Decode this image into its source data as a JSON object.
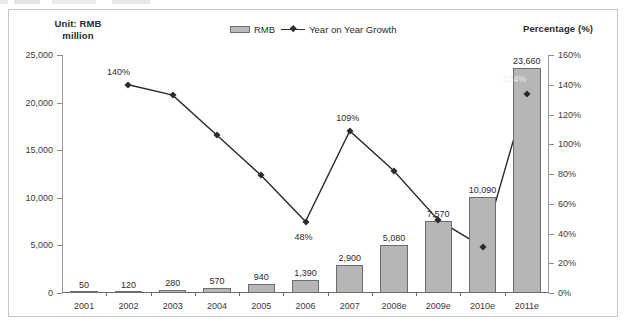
{
  "figure": {
    "left_axis_title": "Unit: RMB\nmillion",
    "left_axis_title_line1": "Unit: RMB",
    "left_axis_title_line2": "million",
    "right_axis_title": "Percentage (%)"
  },
  "legend": {
    "position": "top-center",
    "entries": [
      {
        "label": "RMB",
        "marker": "bar-swatch"
      },
      {
        "label": "Year on Year Growth",
        "marker": "line-diamond"
      }
    ]
  },
  "chart_data": {
    "type": "bar",
    "title": "",
    "subtitle": "",
    "xlabel": "",
    "ylabel": "Unit: RMB million",
    "y2label": "Percentage (%)",
    "grid": false,
    "legend_position": "top-center",
    "categories": [
      "2001",
      "2002",
      "2003",
      "2004",
      "2005",
      "2006",
      "2007",
      "2008e",
      "2009e",
      "2010e",
      "2011e"
    ],
    "ylim": [
      0,
      25000
    ],
    "yticks": [
      0,
      5000,
      10000,
      15000,
      20000,
      25000
    ],
    "ytick_labels": [
      "0",
      "5,000",
      "10,000",
      "15,000",
      "20,000",
      "25,000"
    ],
    "y2lim": [
      0,
      160
    ],
    "y2ticks": [
      0,
      20,
      40,
      60,
      80,
      100,
      120,
      140,
      160
    ],
    "y2tick_labels": [
      "0%",
      "20%",
      "40%",
      "60%",
      "80%",
      "100%",
      "120%",
      "140%",
      "160%"
    ],
    "series": [
      {
        "name": "RMB",
        "type": "bar",
        "axis": "left",
        "color": "#b6b6b6",
        "edge_color": "#6d6d6d",
        "values": [
          50,
          120,
          280,
          570,
          940,
          1390,
          2900,
          5080,
          7570,
          10090,
          23660
        ],
        "data_labels": [
          "50",
          "120",
          "280",
          "570",
          "940",
          "1,390",
          "2,900",
          "5,080",
          "7,570",
          "10,090",
          "23,660"
        ]
      },
      {
        "name": "Year on Year Growth",
        "type": "line",
        "axis": "right",
        "color": "#2b2b2b",
        "marker": "diamond",
        "values": [
          null,
          140,
          133,
          106,
          79,
          48,
          109,
          82,
          49,
          31,
          134
        ],
        "data_labels": [
          null,
          "140%",
          null,
          null,
          null,
          "48%",
          "109%",
          null,
          null,
          null,
          "134%"
        ]
      }
    ],
    "annotations": [
      {
        "text": "140%",
        "category": "2002",
        "value": 140,
        "axis": "right"
      },
      {
        "text": "48%",
        "category": "2006",
        "value": 48,
        "axis": "right"
      },
      {
        "text": "109%",
        "category": "2007",
        "value": 109,
        "axis": "right"
      },
      {
        "text": "134%",
        "category": "2011e",
        "value": 134,
        "axis": "right",
        "style": "light-on-bar"
      }
    ]
  }
}
